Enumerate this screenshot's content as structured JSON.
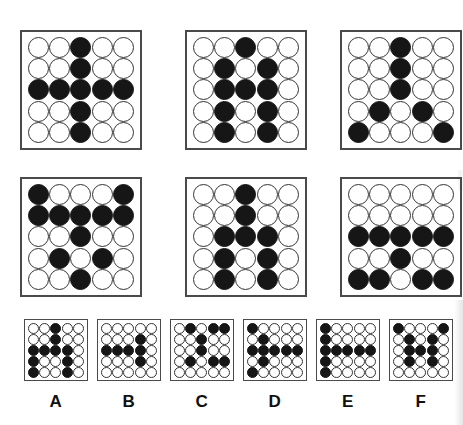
{
  "puzzle": {
    "type": "matrix-reasoning",
    "grid_size": 5,
    "filled_symbol": "●",
    "empty_symbol": "○",
    "colors": {
      "filled": "#161616",
      "empty": "#ffffff",
      "outline": "#333333",
      "frame": "#4a4a4a",
      "background": "#ffffff"
    }
  },
  "matrix": {
    "rows": 2,
    "cols": 3,
    "panels": [
      {
        "id": "matrix-panel-1",
        "position": "row1-col1",
        "name": "plus-cross",
        "grid": [
          [
            0,
            0,
            1,
            0,
            0
          ],
          [
            0,
            0,
            1,
            0,
            0
          ],
          [
            1,
            1,
            1,
            1,
            1
          ],
          [
            0,
            0,
            1,
            0,
            0
          ],
          [
            0,
            0,
            1,
            0,
            0
          ]
        ]
      },
      {
        "id": "matrix-panel-2",
        "position": "row1-col2",
        "name": "narrow-x-on-stem",
        "grid": [
          [
            0,
            0,
            1,
            0,
            0
          ],
          [
            0,
            1,
            0,
            1,
            0
          ],
          [
            0,
            1,
            1,
            1,
            0
          ],
          [
            0,
            1,
            0,
            1,
            0
          ],
          [
            0,
            1,
            0,
            1,
            0
          ]
        ]
      },
      {
        "id": "matrix-panel-3",
        "position": "row1-col3",
        "name": "branching-tree",
        "grid": [
          [
            0,
            0,
            1,
            0,
            0
          ],
          [
            0,
            0,
            1,
            0,
            0
          ],
          [
            0,
            0,
            1,
            0,
            0
          ],
          [
            0,
            1,
            0,
            1,
            0
          ],
          [
            1,
            0,
            0,
            0,
            1
          ]
        ]
      },
      {
        "id": "matrix-panel-4",
        "position": "row2-col1",
        "name": "wide-top-bar-with-stem",
        "grid": [
          [
            1,
            0,
            0,
            0,
            1
          ],
          [
            1,
            1,
            1,
            1,
            1
          ],
          [
            0,
            0,
            1,
            0,
            0
          ],
          [
            0,
            1,
            0,
            1,
            0
          ],
          [
            0,
            0,
            1,
            0,
            0
          ]
        ]
      },
      {
        "id": "matrix-panel-5",
        "position": "row2-col2",
        "name": "stem-with-lower-fork",
        "grid": [
          [
            0,
            0,
            1,
            0,
            0
          ],
          [
            0,
            0,
            1,
            0,
            0
          ],
          [
            0,
            1,
            1,
            1,
            0
          ],
          [
            0,
            1,
            0,
            1,
            0
          ],
          [
            0,
            1,
            0,
            1,
            0
          ]
        ]
      },
      {
        "id": "matrix-panel-6",
        "position": "row2-col3",
        "name": "bar-stem-split-base",
        "grid": [
          [
            0,
            0,
            0,
            0,
            0
          ],
          [
            0,
            0,
            0,
            0,
            0
          ],
          [
            1,
            1,
            1,
            1,
            1
          ],
          [
            0,
            0,
            1,
            0,
            0
          ],
          [
            1,
            1,
            0,
            1,
            1
          ]
        ]
      }
    ]
  },
  "options": [
    {
      "id": "option-a",
      "label": "A",
      "grid": [
        [
          0,
          0,
          1,
          0,
          0
        ],
        [
          0,
          0,
          1,
          0,
          0
        ],
        [
          1,
          1,
          1,
          1,
          0
        ],
        [
          1,
          0,
          0,
          1,
          0
        ],
        [
          1,
          0,
          0,
          1,
          0
        ]
      ]
    },
    {
      "id": "option-b",
      "label": "B",
      "grid": [
        [
          0,
          0,
          0,
          0,
          0
        ],
        [
          0,
          0,
          0,
          1,
          0
        ],
        [
          1,
          1,
          1,
          1,
          0
        ],
        [
          0,
          0,
          0,
          1,
          0
        ],
        [
          0,
          0,
          0,
          0,
          0
        ]
      ]
    },
    {
      "id": "option-c",
      "label": "C",
      "grid": [
        [
          0,
          1,
          0,
          1,
          1
        ],
        [
          0,
          0,
          1,
          0,
          0
        ],
        [
          0,
          0,
          1,
          0,
          0
        ],
        [
          0,
          1,
          0,
          1,
          1
        ],
        [
          0,
          0,
          0,
          0,
          0
        ]
      ]
    },
    {
      "id": "option-d",
      "label": "D",
      "grid": [
        [
          1,
          0,
          0,
          0,
          0
        ],
        [
          0,
          1,
          0,
          0,
          0
        ],
        [
          1,
          1,
          1,
          1,
          1
        ],
        [
          0,
          1,
          0,
          0,
          0
        ],
        [
          1,
          0,
          0,
          0,
          0
        ]
      ]
    },
    {
      "id": "option-e",
      "label": "E",
      "grid": [
        [
          1,
          0,
          0,
          0,
          0
        ],
        [
          1,
          0,
          0,
          0,
          0
        ],
        [
          1,
          1,
          1,
          1,
          1
        ],
        [
          1,
          0,
          0,
          0,
          0
        ],
        [
          1,
          0,
          0,
          0,
          0
        ]
      ]
    },
    {
      "id": "option-f",
      "label": "F",
      "grid": [
        [
          1,
          0,
          0,
          0,
          1
        ],
        [
          0,
          1,
          0,
          1,
          0
        ],
        [
          0,
          1,
          1,
          1,
          0
        ],
        [
          0,
          1,
          0,
          1,
          0
        ],
        [
          0,
          0,
          0,
          0,
          0
        ]
      ]
    }
  ],
  "layout": {
    "matrix_panel_positions": [
      {
        "left": 20,
        "top": 30
      },
      {
        "left": 185,
        "top": 30
      },
      {
        "left": 340,
        "top": 30
      },
      {
        "left": 20,
        "top": 177
      },
      {
        "left": 185,
        "top": 177
      },
      {
        "left": 340,
        "top": 177
      }
    ],
    "option_panel_positions": [
      {
        "left": 24,
        "top": 319
      },
      {
        "left": 97,
        "top": 319
      },
      {
        "left": 170,
        "top": 319
      },
      {
        "left": 243,
        "top": 319
      },
      {
        "left": 316,
        "top": 319
      },
      {
        "left": 389,
        "top": 319
      }
    ],
    "option_label_top": 392
  }
}
